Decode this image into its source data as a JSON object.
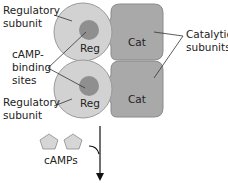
{
  "diagram": {
    "labels": {
      "regulatory_subunit_top": [
        "Regulatory",
        "subunit"
      ],
      "regulatory_subunit_bottom": [
        "Regulatory",
        "subunit"
      ],
      "camp_binding_sites": [
        "cAMP-",
        "binding",
        "sites"
      ],
      "catalytic_subunits": [
        "Catalytic",
        "subunits"
      ],
      "camps": "cAMPs"
    },
    "subunits": {
      "reg_top": "Reg",
      "reg_bottom": "Reg",
      "cat_top": "Cat",
      "cat_bottom": "Cat"
    },
    "colors": {
      "regulatory_fill": "#d2d2d2",
      "binding_site_fill": "#8f8f8f",
      "catalytic_fill": "#a9a9a9",
      "outline": "#8a8a8a",
      "pentagon_fill": "#d6d6d6"
    }
  }
}
